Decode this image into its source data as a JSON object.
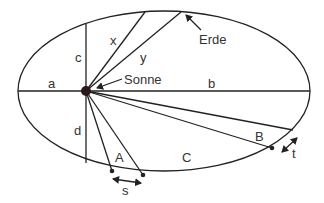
{
  "diagram": {
    "colors": {
      "line": "#222222",
      "text": "#333333",
      "background": "#ffffff"
    },
    "bodies": {
      "sun_label": "Sonne",
      "earth_label": "Erde"
    },
    "segment_labels": {
      "a": "a",
      "b": "b",
      "c": "c",
      "d": "d",
      "x": "x",
      "y": "y"
    },
    "area_labels": {
      "A": "A",
      "B": "B",
      "C": "C"
    },
    "arc_labels": {
      "s": "s",
      "t": "t"
    }
  }
}
